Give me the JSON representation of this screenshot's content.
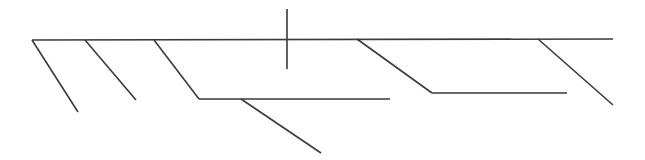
{
  "diagram": {
    "type": "line-skeleton",
    "stroke_color": "#3a3a3a",
    "stroke_width": 1.6,
    "background": "#ffffff",
    "segments": [
      {
        "name": "main-spine",
        "x1": 32,
        "y1": 40,
        "x2": 613,
        "y2": 39
      },
      {
        "name": "branch-1",
        "x1": 32,
        "y1": 40,
        "x2": 78,
        "y2": 112
      },
      {
        "name": "branch-2",
        "x1": 85,
        "y1": 40,
        "x2": 136,
        "y2": 100
      },
      {
        "name": "branch-3-diagonal",
        "x1": 154,
        "y1": 40,
        "x2": 199,
        "y2": 99
      },
      {
        "name": "branch-3-horizontal",
        "x1": 199,
        "y1": 99,
        "x2": 390,
        "y2": 99
      },
      {
        "name": "branch-3-sub",
        "x1": 241,
        "y1": 99,
        "x2": 321,
        "y2": 153
      },
      {
        "name": "vertical-cross",
        "x1": 287,
        "y1": 9,
        "x2": 287,
        "y2": 69
      },
      {
        "name": "branch-4-diagonal",
        "x1": 357,
        "y1": 39,
        "x2": 432,
        "y2": 93
      },
      {
        "name": "branch-4-horizontal",
        "x1": 432,
        "y1": 93,
        "x2": 567,
        "y2": 93
      },
      {
        "name": "branch-5",
        "x1": 538,
        "y1": 39,
        "x2": 613,
        "y2": 105
      }
    ]
  }
}
